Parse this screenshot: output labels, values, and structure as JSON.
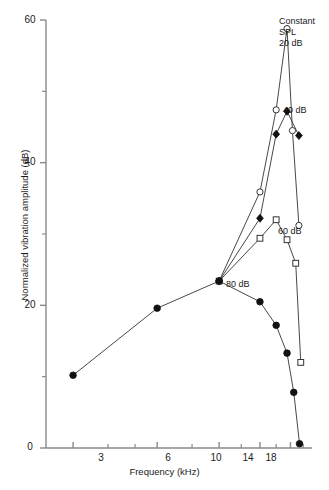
{
  "chart_data": {
    "type": "line",
    "title": "",
    "xlabel": "Frequency (kHz)",
    "ylabel": "Normalized vibration amplitude (dB)",
    "xscale": "log",
    "xlim": [
      2.4,
      21.5
    ],
    "ylim": [
      0,
      60
    ],
    "xticks": [
      3,
      6,
      10,
      14,
      18
    ],
    "xtick_labels": [
      "3",
      "6",
      "10",
      "14",
      "18"
    ],
    "xminor_ticks": [
      4,
      5,
      8,
      12,
      16,
      20
    ],
    "yticks": [
      0,
      20,
      40,
      60
    ],
    "ytick_labels": [
      "0",
      "20",
      "40",
      "60"
    ],
    "yminor_ticks": [
      10,
      30,
      50
    ],
    "grid": false,
    "legend_position": "inline-annotations",
    "series": [
      {
        "name": "Constant SPL 20 dB",
        "marker": "open-circle",
        "x": [
          10,
          14,
          16,
          17.5,
          18.3,
          19.3
        ],
        "y": [
          23.4,
          35.9,
          47.4,
          58.8,
          44.5,
          31.2
        ]
      },
      {
        "name": "40 dB",
        "marker": "filled-diamond",
        "x": [
          10,
          14,
          16,
          17.5,
          19.3
        ],
        "y": [
          23.4,
          32.2,
          44.0,
          47.2,
          43.8
        ]
      },
      {
        "name": "60 dB",
        "marker": "open-square",
        "x": [
          10,
          14,
          16,
          17.5,
          18.8,
          19.6
        ],
        "y": [
          23.4,
          29.4,
          32.0,
          29.2,
          25.9,
          12.0
        ]
      },
      {
        "name": "80 dB",
        "marker": "filled-circle",
        "x": [
          3,
          6,
          10,
          14,
          16,
          17.5,
          18.5,
          19.4
        ],
        "y": [
          10.2,
          19.6,
          23.4,
          20.5,
          17.2,
          13.3,
          7.8,
          0.6
        ]
      }
    ],
    "annotations": [
      {
        "id": "ann-constant-spl",
        "text": "Constant\nSPL\n20 dB",
        "x_px": 279,
        "y_px": 16
      },
      {
        "id": "ann-40db",
        "text": "40 dB",
        "x_px": 283,
        "y_px": 105
      },
      {
        "id": "ann-60db",
        "text": "60 dB",
        "x_px": 278,
        "y_px": 226
      },
      {
        "id": "ann-80db",
        "text": "80 dB",
        "x_px": 226,
        "y_px": 279
      }
    ]
  }
}
